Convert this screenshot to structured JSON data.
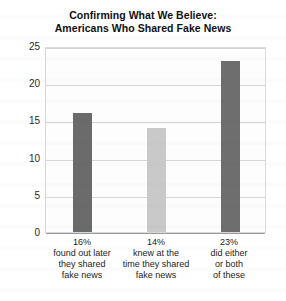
{
  "chart_data": {
    "type": "bar",
    "title": "Confirming What We Believe:\nAmericans Who Shared Fake News",
    "title_lines": [
      "Confirming What We Believe:",
      "Americans Who Shared Fake News"
    ],
    "categories": [
      "16% found out later they shared fake news",
      "14% knew at the time they shared fake news",
      "23% did either or both of these"
    ],
    "category_lines": [
      [
        "16%",
        "found out later",
        "they shared",
        "fake news"
      ],
      [
        "14%",
        "knew at the",
        "time they shared",
        "fake news"
      ],
      [
        "23%",
        "did either",
        "or both",
        "of these"
      ]
    ],
    "values": [
      16,
      14,
      23
    ],
    "xlabel": "",
    "ylabel": "",
    "ylim": [
      0,
      25
    ],
    "yticks": [
      0,
      5,
      10,
      15,
      20,
      25
    ],
    "ytick_labels": [
      "0",
      "5",
      "10",
      "15",
      "20",
      "25"
    ],
    "grid": true,
    "legend": false,
    "bar_colors": [
      "#6b6b6b",
      "#c9c9c9",
      "#6e6e6e"
    ]
  },
  "colors": {
    "bar_dark": "#6b6b6b",
    "bar_light": "#c9c9c9",
    "gridline": "#d6d6d6",
    "axis": "#9a9a9a",
    "text": "#1d1d1d",
    "background": "#ffffff"
  }
}
